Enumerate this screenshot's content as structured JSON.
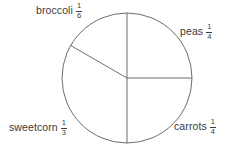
{
  "figure": {
    "width": 233,
    "height": 148,
    "background": "#ffffff"
  },
  "chart_data": {
    "type": "pie",
    "title": "",
    "subtitle": "",
    "xlabel": "",
    "ylabel": "",
    "grid": false,
    "legend_position": "none",
    "labels_outside": true,
    "center": {
      "x": 127,
      "y": 78
    },
    "radius": 65,
    "stroke_color": "#6d6d6d",
    "stroke_width": 1,
    "fill_color": "none",
    "start_angle_deg": 90,
    "direction": "clockwise",
    "categories": [
      "peas",
      "carrots",
      "sweetcorn",
      "broccoli"
    ],
    "values": [
      0.25,
      0.25,
      0.3333333333,
      0.1666666667
    ],
    "value_labels": [
      "1/4",
      "1/4",
      "1/3",
      "1/6"
    ],
    "slices": [
      {
        "name": "peas",
        "fraction_text": "1/4",
        "numerator": "1",
        "denominator": "4",
        "value": 0.25,
        "angle_deg": 90,
        "start_deg": 90,
        "end_deg": 0
      },
      {
        "name": "carrots",
        "fraction_text": "1/4",
        "numerator": "1",
        "denominator": "4",
        "value": 0.25,
        "angle_deg": 90,
        "start_deg": 0,
        "end_deg": -90
      },
      {
        "name": "sweetcorn",
        "fraction_text": "1/3",
        "numerator": "1",
        "denominator": "3",
        "value": 0.3333333333,
        "angle_deg": 120,
        "start_deg": -90,
        "end_deg": -210
      },
      {
        "name": "broccoli",
        "fraction_text": "1/6",
        "numerator": "1",
        "denominator": "6",
        "value": 0.1666666667,
        "angle_deg": 60,
        "start_deg": 150,
        "end_deg": 90
      }
    ]
  },
  "labels": {
    "broccoli": {
      "name": "broccoli",
      "numerator": "1",
      "denominator": "6"
    },
    "peas": {
      "name": "peas",
      "numerator": "1",
      "denominator": "4"
    },
    "sweetcorn": {
      "name": "sweetcorn",
      "numerator": "1",
      "denominator": "3"
    },
    "carrots": {
      "name": "carrots",
      "numerator": "1",
      "denominator": "4"
    }
  },
  "colors": {
    "text": "#3b3b3b",
    "stroke": "#6d6d6d",
    "background": "#ffffff"
  }
}
